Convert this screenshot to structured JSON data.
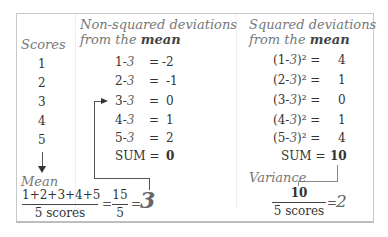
{
  "columns": {
    "scores": {
      "header": "Scores",
      "values": [
        "1",
        "2",
        "3",
        "4",
        "5"
      ]
    },
    "non_squared": {
      "header_line1": "Non-squared deviations",
      "header_line2_prefix": "from the ",
      "header_line2_bold": "mean",
      "rows": [
        {
          "score": "1",
          "minus": "-",
          "mean": "3",
          "eq": "=",
          "result": "-2"
        },
        {
          "score": "2",
          "minus": "-",
          "mean": "3",
          "eq": "=",
          "result": "-1"
        },
        {
          "score": "3",
          "minus": "-",
          "mean": "3",
          "eq": "=",
          "result": "0"
        },
        {
          "score": "4",
          "minus": "-",
          "mean": "3",
          "eq": "=",
          "result": "1"
        },
        {
          "score": "5",
          "minus": "-",
          "mean": "3",
          "eq": "=",
          "result": "2"
        }
      ],
      "sum_label": "SUM =",
      "sum_value": "0"
    },
    "squared": {
      "header_line1": "Squared deviations",
      "header_line2_prefix": "from the ",
      "header_line2_bold": "mean",
      "rows": [
        {
          "expr_open": "(1-",
          "mean": "3",
          "expr_close": ")² =",
          "result": "4"
        },
        {
          "expr_open": "(2-",
          "mean": "3",
          "expr_close": ")² =",
          "result": "1"
        },
        {
          "expr_open": "(3-",
          "mean": "3",
          "expr_close": ")² =",
          "result": "0"
        },
        {
          "expr_open": "(4-",
          "mean": "3",
          "expr_close": ")² =",
          "result": "1"
        },
        {
          "expr_open": "(5-",
          "mean": "3",
          "expr_close": ")² =",
          "result": "4"
        }
      ],
      "sum_label": "SUM =",
      "sum_value": "10"
    }
  },
  "mean": {
    "label": "Mean",
    "numerator": "1+2+3+4+5",
    "denominator": "5 scores",
    "eq1": "=",
    "frac2_num": "15",
    "frac2_den": "5",
    "eq2": "=",
    "result": "3"
  },
  "variance": {
    "label": "Variance",
    "numerator": "10",
    "denominator": "5 scores",
    "eq": "=",
    "result": "2"
  },
  "colors": {
    "frame_border": "#c8c8c8",
    "header_text": "#777777",
    "arrow": "#555555",
    "body_text": "#333333"
  }
}
